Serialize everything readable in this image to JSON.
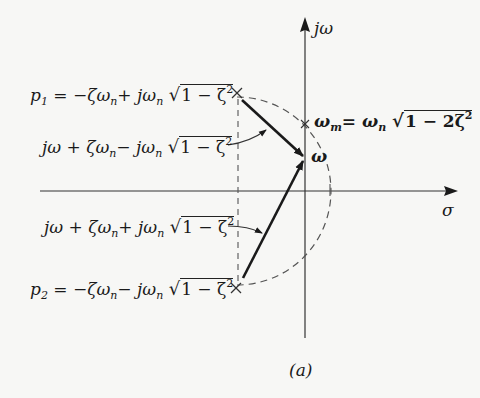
{
  "diagram": {
    "type": "s-plane pole-zero vector diagram",
    "caption": "(a)",
    "axes": {
      "vertical_label": "jω",
      "horizontal_label": "σ"
    },
    "poles": [
      {
        "name": "p1",
        "label_lhs": "p",
        "label_sub": "1",
        "label_rhs": "= −ζω",
        "sub_n": "n",
        "mid": "+ jω",
        "sqrt_body": "1 − ζ",
        "sqrt_sup": "2"
      },
      {
        "name": "p2",
        "label_lhs": "p",
        "label_sub": "2",
        "label_rhs": "= −ζω",
        "sub_n": "n",
        "mid": "− jω",
        "sqrt_body": "1 − ζ",
        "sqrt_sup": "2"
      }
    ],
    "vectors": [
      {
        "name": "upper-vector",
        "pre": "jω + ζω",
        "sub_n": "n",
        "mid": "− jω",
        "sqrt_body": "1 − ζ",
        "sqrt_sup": "2"
      },
      {
        "name": "lower-vector",
        "pre": "jω + ζω",
        "sub_n": "n",
        "mid": "+ jω",
        "sqrt_body": "1 − ζ",
        "sqrt_sup": "2"
      }
    ],
    "omega_point_label": "ω",
    "omega_m": {
      "lhs": "ω",
      "lhs_sub": "m",
      "eq": "= ω",
      "eq_sub": "n",
      "sqrt_body": "1 − 2ζ",
      "sqrt_sup": "2"
    },
    "colors": {
      "ink": "#1a1a1a",
      "dashed": "#555555",
      "background": "#f7f7f5"
    }
  }
}
